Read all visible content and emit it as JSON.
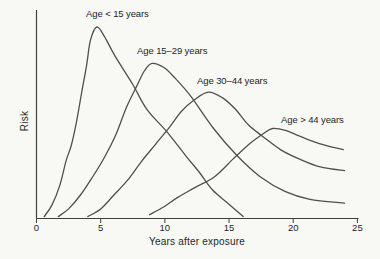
{
  "figure": {
    "background": "#f8f8f5"
  },
  "chart_data": {
    "type": "line",
    "title": "",
    "xlabel": "Years after exposure",
    "ylabel": "Risk",
    "x_ticks": [
      0,
      5,
      10,
      15,
      20,
      25
    ],
    "xlim": [
      0,
      25
    ],
    "ylim": [
      0,
      1.1
    ],
    "y_axis_has_tick_labels": false,
    "grid": false,
    "legend_position": "inline-annotations",
    "curve_color": "#4f4f4f",
    "axis_color": "#3f3f3f",
    "text_color": "#1f1f1f",
    "series": [
      {
        "name": "age-under-15",
        "label": "Age < 15 years",
        "peak": {
          "x": 4.7,
          "y": 1.0
        },
        "points": [
          [
            0.6,
            0.01
          ],
          [
            1.2,
            0.07
          ],
          [
            1.8,
            0.17
          ],
          [
            2.3,
            0.3
          ],
          [
            2.7,
            0.38
          ],
          [
            3.1,
            0.5
          ],
          [
            3.5,
            0.65
          ],
          [
            3.9,
            0.8
          ],
          [
            4.2,
            0.93
          ],
          [
            4.7,
            1.0
          ],
          [
            5.3,
            0.95
          ],
          [
            6.1,
            0.85
          ],
          [
            7.5,
            0.7
          ],
          [
            8.6,
            0.57
          ],
          [
            10.2,
            0.45
          ],
          [
            11.6,
            0.33
          ],
          [
            12.7,
            0.24
          ],
          [
            13.7,
            0.15
          ],
          [
            14.9,
            0.08
          ],
          [
            16.1,
            0.01
          ]
        ]
      },
      {
        "name": "age-15-29",
        "label": "Age 15–29 years",
        "peak": {
          "x": 9.0,
          "y": 0.81
        },
        "points": [
          [
            1.7,
            0.01
          ],
          [
            2.5,
            0.05
          ],
          [
            3.4,
            0.12
          ],
          [
            4.3,
            0.21
          ],
          [
            5.3,
            0.32
          ],
          [
            6.2,
            0.44
          ],
          [
            7.0,
            0.58
          ],
          [
            7.8,
            0.69
          ],
          [
            8.4,
            0.77
          ],
          [
            9.0,
            0.81
          ],
          [
            9.9,
            0.79
          ],
          [
            10.7,
            0.74
          ],
          [
            12.0,
            0.64
          ],
          [
            13.8,
            0.47
          ],
          [
            15.6,
            0.33
          ],
          [
            17.4,
            0.22
          ],
          [
            19.4,
            0.14
          ],
          [
            21.3,
            0.1
          ],
          [
            24.0,
            0.08
          ]
        ]
      },
      {
        "name": "age-30-44",
        "label": "Age 30–44 years",
        "peak": {
          "x": 13.4,
          "y": 0.66
        },
        "points": [
          [
            4.0,
            0.01
          ],
          [
            5.0,
            0.05
          ],
          [
            6.0,
            0.12
          ],
          [
            7.1,
            0.2
          ],
          [
            8.2,
            0.3
          ],
          [
            9.3,
            0.39
          ],
          [
            10.4,
            0.48
          ],
          [
            11.3,
            0.56
          ],
          [
            12.3,
            0.62
          ],
          [
            13.4,
            0.66
          ],
          [
            14.5,
            0.63
          ],
          [
            15.5,
            0.57
          ],
          [
            16.5,
            0.49
          ],
          [
            17.6,
            0.43
          ],
          [
            19.0,
            0.36
          ],
          [
            20.5,
            0.31
          ],
          [
            22.1,
            0.27
          ],
          [
            24.0,
            0.25
          ]
        ]
      },
      {
        "name": "age-over-44",
        "label": "Age > 44 years",
        "peak": {
          "x": 18.4,
          "y": 0.47
        },
        "points": [
          [
            8.8,
            0.02
          ],
          [
            9.9,
            0.06
          ],
          [
            11.0,
            0.11
          ],
          [
            12.3,
            0.16
          ],
          [
            13.9,
            0.22
          ],
          [
            15.3,
            0.31
          ],
          [
            16.6,
            0.39
          ],
          [
            17.6,
            0.44
          ],
          [
            18.4,
            0.47
          ],
          [
            19.4,
            0.46
          ],
          [
            20.5,
            0.43
          ],
          [
            22.1,
            0.39
          ],
          [
            23.9,
            0.36
          ]
        ]
      }
    ]
  }
}
